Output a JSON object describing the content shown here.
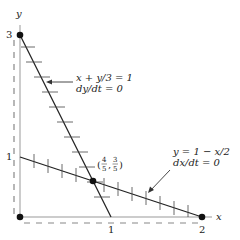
{
  "diagram": {
    "type": "phase-plane nullclines",
    "axes": {
      "x_label": "x",
      "y_label": "y",
      "x_ticks": [
        "1",
        "2"
      ],
      "y_ticks": [
        "1",
        "3"
      ]
    },
    "nullclines": [
      {
        "equation": "x + y/3 = 1",
        "condition": "dy/dt = 0",
        "tick_orientation": "horizontal"
      },
      {
        "equation": "y = 1 − x/2",
        "condition": "dx/dt = 0",
        "tick_orientation": "vertical"
      }
    ],
    "equilibria": [
      {
        "label": "",
        "x": 0,
        "y": 0
      },
      {
        "label": "",
        "x": 0,
        "y": 3
      },
      {
        "label": "",
        "x": 2,
        "y": 0
      },
      {
        "label": "(4/5, 3/5)",
        "x": 0.8,
        "y": 0.6,
        "num_x": "4",
        "den_x": "5",
        "num_y": "3",
        "den_y": "5"
      }
    ],
    "colors": {
      "line": "#222222",
      "dashed": "#888888",
      "axis": "#999999"
    }
  }
}
